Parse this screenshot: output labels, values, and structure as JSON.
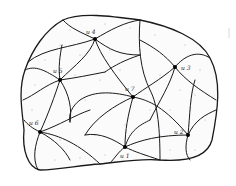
{
  "diagram": {
    "type": "planar-subdivision",
    "colors": {
      "stroke": "#1a1a1a",
      "fill": "#fbfbfb",
      "stipple": "#9a9a9a",
      "vertex": "#000000"
    },
    "vertices": [
      {
        "id": "u1",
        "label": "u 1",
        "x": 125,
        "y": 147,
        "lx": 120,
        "ly": 157
      },
      {
        "id": "u2",
        "label": "u 2",
        "x": 188,
        "y": 135,
        "lx": 175,
        "ly": 133
      },
      {
        "id": "u3",
        "label": "u 3",
        "x": 175,
        "y": 67,
        "lx": 181,
        "ly": 70
      },
      {
        "id": "u4",
        "label": "u 4",
        "x": 95,
        "y": 39,
        "lx": 86,
        "ly": 34
      },
      {
        "id": "u5",
        "label": "u 5",
        "x": 60,
        "y": 80,
        "lx": 53,
        "ly": 73
      },
      {
        "id": "u6",
        "label": "u 6",
        "x": 40,
        "y": 132,
        "lx": 30,
        "ly": 124
      },
      {
        "id": "u7",
        "label": "u 7",
        "x": 133,
        "y": 97,
        "lx": 126,
        "ly": 91
      }
    ]
  }
}
